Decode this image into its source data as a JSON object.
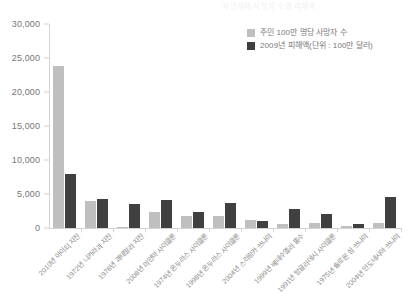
{
  "chart_data": {
    "type": "bar",
    "title": "자연재해 사망자 수와 피해액",
    "xlabel": "",
    "ylabel": "",
    "ylim": [
      0,
      30000
    ],
    "ytick_step": 5000,
    "ytick_labels": [
      "0",
      "5,000",
      "10,000",
      "15,000",
      "20,000",
      "25,000",
      "30,000"
    ],
    "ytick_values": [
      0,
      5000,
      10000,
      15000,
      20000,
      25000,
      30000
    ],
    "grid": false,
    "legend_position": "top-right",
    "categories": [
      "2010년 아이티 지진",
      "1972년 니카라과 지진",
      "1976년 과테말라 지진",
      "2008년 미얀마 사이클론",
      "1974년 온두라스 사이클론",
      "1998년 온두라스 사이클론",
      "2004년 스리랑카 쓰나미",
      "1999년 베네수엘라 홍수",
      "1991년 방글라데시 사이클론",
      "1975년 솔로몬 섬 쓰나미",
      "2004년 인도네시아 쓰나미"
    ],
    "series": [
      {
        "name": "주민 100만 명당 사망자 수",
        "color": "#bfbfbf",
        "values": [
          23800,
          4000,
          150,
          2400,
          1800,
          1800,
          1200,
          600,
          700,
          250,
          800
        ]
      },
      {
        "name": "2009년 피해액(단위 : 100만 달러)",
        "color": "#404040",
        "values": [
          8000,
          4300,
          3500,
          4100,
          2300,
          3700,
          1000,
          2800,
          2100,
          600,
          4500
        ]
      }
    ]
  }
}
